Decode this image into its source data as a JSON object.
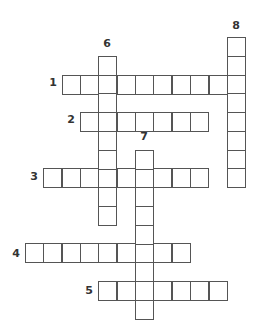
{
  "puzzle": {
    "type": "crossword",
    "grid_origin": {
      "x": 25,
      "y": 37
    },
    "cell_w": 18.35,
    "cell_h": 18.75,
    "colors": {
      "border": "#555555",
      "cell_fill": "#ffffff",
      "label": "#333333"
    },
    "entries": [
      {
        "number": "1",
        "direction": "across",
        "row": 2,
        "col": 2,
        "length": 10,
        "label_pos": {
          "x": 46,
          "y": 77
        }
      },
      {
        "number": "2",
        "direction": "across",
        "row": 4,
        "col": 3,
        "length": 7,
        "label_pos": {
          "x": 64,
          "y": 114
        }
      },
      {
        "number": "3",
        "direction": "across",
        "row": 7,
        "col": 1,
        "length": 9,
        "label_pos": {
          "x": 27,
          "y": 171
        }
      },
      {
        "number": "4",
        "direction": "across",
        "row": 11,
        "col": 0,
        "length": 9,
        "label_pos": {
          "x": 9,
          "y": 248
        }
      },
      {
        "number": "5",
        "direction": "across",
        "row": 13,
        "col": 4,
        "length": 7,
        "label_pos": {
          "x": 82,
          "y": 285
        }
      },
      {
        "number": "6",
        "direction": "down",
        "row": 1,
        "col": 4,
        "length": 9,
        "label_pos": {
          "x": 100,
          "y": 38
        }
      },
      {
        "number": "7",
        "direction": "down",
        "row": 6,
        "col": 6,
        "length": 9,
        "label_pos": {
          "x": 137,
          "y": 131
        }
      },
      {
        "number": "8",
        "direction": "down",
        "row": 0,
        "col": 11,
        "length": 8,
        "label_pos": {
          "x": 229,
          "y": 20
        }
      }
    ]
  }
}
